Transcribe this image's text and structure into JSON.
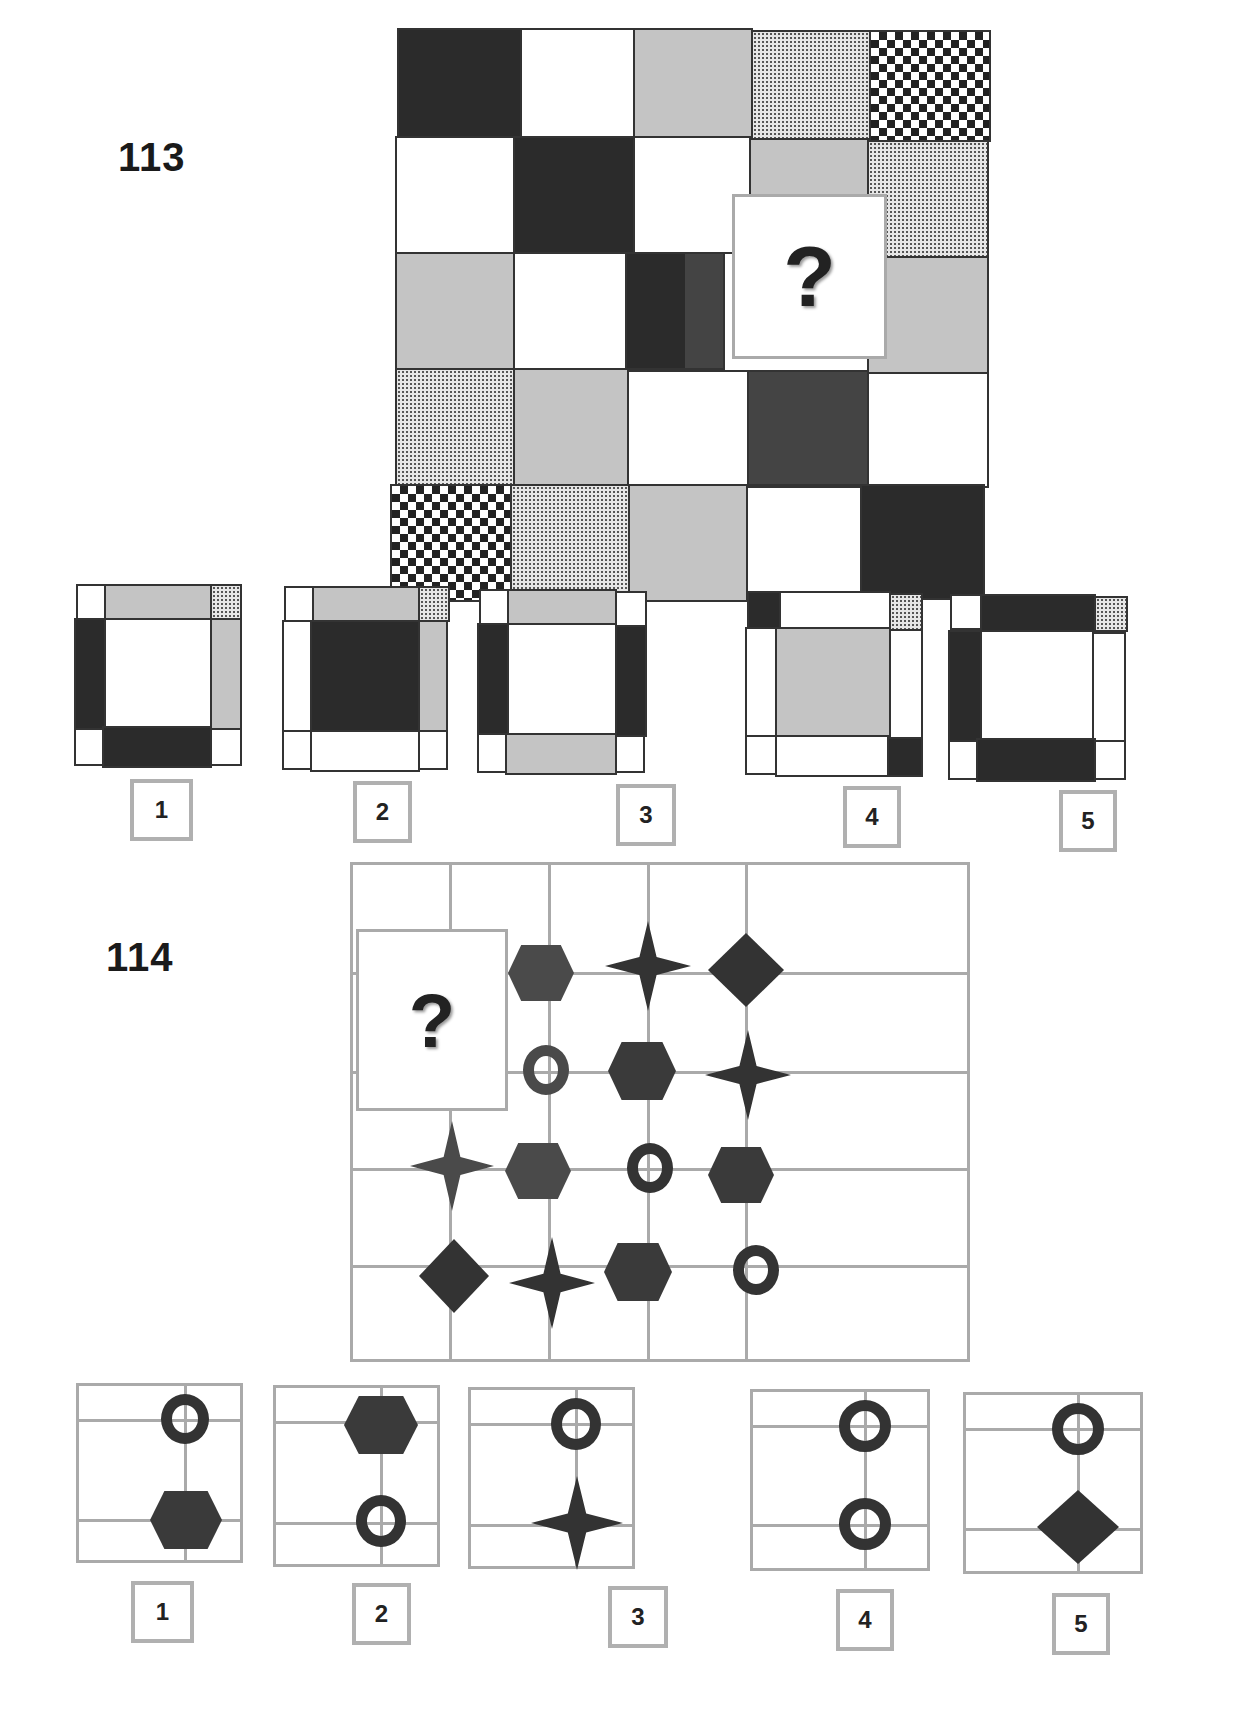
{
  "puzzles": [
    {
      "number": "113",
      "question_mark": "?",
      "grid_rows": 5,
      "grid_cols": 5,
      "grid": [
        [
          "dark",
          "white",
          "gray",
          "dots",
          "check"
        ],
        [
          "white",
          "dark",
          "white",
          "gray",
          "dots"
        ],
        [
          "gray",
          "white",
          "dark",
          "missing",
          "gray"
        ],
        [
          "dots",
          "gray",
          "white",
          "dark",
          "white"
        ],
        [
          "check",
          "dots",
          "gray",
          "white",
          "dark"
        ]
      ],
      "options": [
        {
          "label": "1",
          "description": "white center; top gray, top-right dots, left dark, right gray, bottom dark, white corners"
        },
        {
          "label": "2",
          "description": "dark center; top gray, top-right dots, left white, right gray, bottom white, white corners"
        },
        {
          "label": "3",
          "description": "white center; top gray, left dark, right dark, bottom gray, white corners"
        },
        {
          "label": "4",
          "description": "gray center; top-left dark, top white, top-right dots, left white, right white, bottom white, bottom-right dark"
        },
        {
          "label": "5",
          "description": "white center; top dark, top-right dots, left dark, right white, bottom dark, white corners"
        }
      ]
    },
    {
      "number": "114",
      "question_mark": "?",
      "grid_shapes": [
        [
          "missing",
          "missing",
          "hexagon",
          "star",
          "diamond"
        ],
        [
          "missing",
          "missing",
          "ring",
          "hexagon",
          "star"
        ],
        [
          "",
          "star",
          "hexagon",
          "ring",
          "hexagon"
        ],
        [
          "",
          "diamond",
          "star",
          "hexagon",
          "ring"
        ]
      ],
      "options": [
        {
          "label": "1",
          "top": "ring",
          "bottom": "hexagon"
        },
        {
          "label": "2",
          "top": "hexagon",
          "bottom": "ring"
        },
        {
          "label": "3",
          "top": "ring",
          "bottom": "star"
        },
        {
          "label": "4",
          "top": "ring",
          "bottom": "ring"
        },
        {
          "label": "5",
          "top": "ring",
          "bottom": "diamond"
        }
      ]
    }
  ]
}
